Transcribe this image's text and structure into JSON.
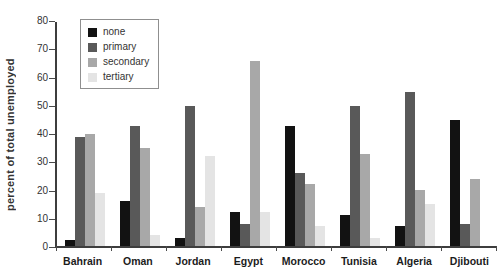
{
  "chart_data": {
    "type": "bar",
    "title": "",
    "ylabel": "percent of total unemployed",
    "xlabel": "",
    "ylim": [
      0,
      80
    ],
    "ytick_step": 10,
    "grid": false,
    "legend_position": "top-left",
    "categories": [
      "Bahrain",
      "Oman",
      "Jordan",
      "Egypt",
      "Morocco",
      "Tunisia",
      "Algeria",
      "Djibouti"
    ],
    "series": [
      {
        "name": "none",
        "color": "#121212",
        "values": [
          2,
          16,
          3,
          12,
          43,
          11,
          7,
          45
        ]
      },
      {
        "name": "primary",
        "color": "#595959",
        "values": [
          39,
          43,
          50,
          8,
          26,
          50,
          55,
          8
        ]
      },
      {
        "name": "secondary",
        "color": "#a8a8a8",
        "values": [
          40,
          35,
          14,
          66,
          22,
          33,
          20,
          24
        ]
      },
      {
        "name": "tertiary",
        "color": "#e4e4e4",
        "values": [
          19,
          4,
          32,
          12,
          7,
          3,
          15,
          0
        ]
      }
    ]
  },
  "colors": {
    "axis": "#3d3d3d",
    "tick_text": "#333333",
    "category_text": "#1c1c1c",
    "legend_border": "#8f8f8f"
  }
}
